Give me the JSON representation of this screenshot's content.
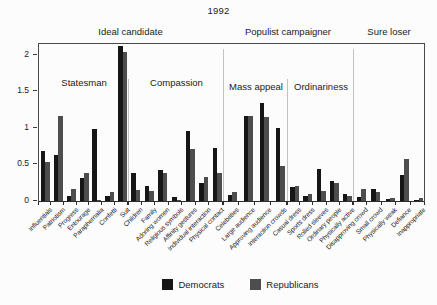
{
  "chart_data": {
    "type": "bar",
    "title": "1992",
    "grid": false,
    "legend_position": "bottom-center",
    "ylim": [
      0,
      2.16
    ],
    "yticks": [
      "0",
      "0.5",
      "1",
      "1.5",
      "2"
    ],
    "legend": [
      {
        "name": "Democrats",
        "color": "#161616"
      },
      {
        "name": "Republicans",
        "color": "#4d4d4d"
      }
    ],
    "top_groups": [
      {
        "label": "Ideal candidate",
        "section_indices": [
          0,
          1
        ]
      },
      {
        "label": "Populist campaigner",
        "section_indices": [
          2,
          3
        ]
      },
      {
        "label": "Sure loser",
        "section_indices": [
          4
        ]
      }
    ],
    "sections": [
      {
        "name": "Statesman",
        "label_shown": true,
        "categories": [
          "Influentials",
          "Patriotism",
          "Progress",
          "Entourage",
          "Paraphernalia",
          "Confetti",
          "Suit"
        ],
        "series": [
          {
            "name": "Democrats",
            "values": [
              0.68,
              0.63,
              0.07,
              0.31,
              0.98,
              0.07,
              2.12
            ]
          },
          {
            "name": "Republicans",
            "values": [
              0.54,
              1.16,
              0.16,
              0.38,
              0.02,
              0.13,
              2.04
            ]
          }
        ]
      },
      {
        "name": "Compassion",
        "label_shown": true,
        "categories": [
          "Children",
          "Family",
          "Adoring women",
          "Religious symbols",
          "Affinity gestures",
          "Individual interaction",
          "Physical contact"
        ],
        "series": [
          {
            "name": "Democrats",
            "values": [
              0.39,
              0.21,
              0.42,
              0.06,
              0.96,
              0.25,
              0.73
            ]
          },
          {
            "name": "Republicans",
            "values": [
              0.15,
              0.14,
              0.39,
              0.01,
              0.71,
              0.33,
              0.38
            ]
          }
        ]
      },
      {
        "name": "Mass appeal",
        "label_shown": true,
        "categories": [
          "Celebrities",
          "Large audience",
          "Approving audience",
          "Interaction crowds"
        ],
        "series": [
          {
            "name": "Democrats",
            "values": [
              0.08,
              1.17,
              1.34,
              1.0
            ]
          },
          {
            "name": "Republicans",
            "values": [
              0.12,
              1.17,
              1.15,
              0.48
            ]
          }
        ]
      },
      {
        "name": "Ordinariness",
        "label_shown": true,
        "categories": [
          "Casual dress",
          "Sports dress",
          "Rolled sleeves",
          "Ordinary people",
          "Physically active"
        ],
        "series": [
          {
            "name": "Democrats",
            "values": [
              0.19,
              0.07,
              0.44,
              0.27,
              0.1
            ]
          },
          {
            "name": "Republicans",
            "values": [
              0.21,
              0.1,
              0.14,
              0.25,
              0.07
            ]
          }
        ]
      },
      {
        "name": "Sure loser",
        "label_shown": false,
        "categories": [
          "Disapproving crowd",
          "Small crowd",
          "Physically weak",
          "Defiance",
          "Inappropriate"
        ],
        "series": [
          {
            "name": "Democrats",
            "values": [
              0.06,
              0.17,
              0.03,
              0.36,
              0.02
            ]
          },
          {
            "name": "Republicans",
            "values": [
              0.17,
              0.13,
              0.04,
              0.58,
              0.04
            ]
          }
        ]
      }
    ],
    "colors": {
      "democrats": "#161616",
      "republicans": "#4d4d4d",
      "divider": "#c2c2c2",
      "axis": "#2e2e2e",
      "background": "#fcfcfc"
    }
  }
}
